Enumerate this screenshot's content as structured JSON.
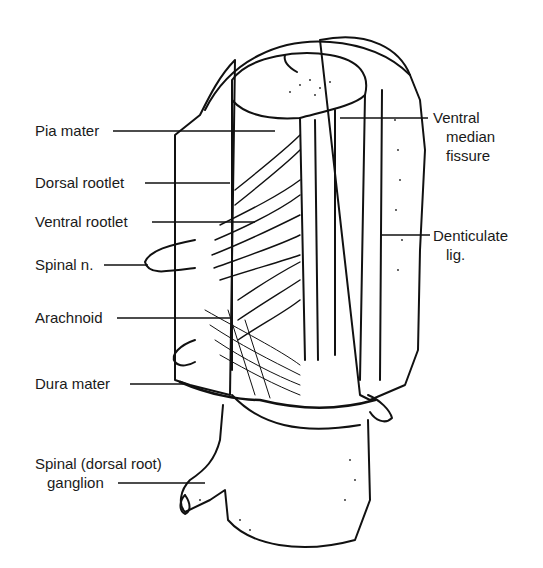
{
  "figure": {
    "labels_left": [
      {
        "id": "pia-mater",
        "text": "Pia mater"
      },
      {
        "id": "dorsal-rootlet",
        "text": "Dorsal rootlet"
      },
      {
        "id": "ventral-rootlet",
        "text": "Ventral rootlet"
      },
      {
        "id": "spinal-n",
        "text": "Spinal n."
      },
      {
        "id": "arachnoid",
        "text": "Arachnoid"
      },
      {
        "id": "dura-mater",
        "text": "Dura mater"
      },
      {
        "id": "spinal-ganglion",
        "text_line1": "Spinal (dorsal root)",
        "text_line2": "ganglion"
      }
    ],
    "labels_right": [
      {
        "id": "ventral-median-fissure",
        "text_line1": "Ventral",
        "text_line2": "median",
        "text_line3": "fissure"
      },
      {
        "id": "denticulate-lig",
        "text_line1": "Denticulate",
        "text_line2": "lig."
      }
    ]
  }
}
